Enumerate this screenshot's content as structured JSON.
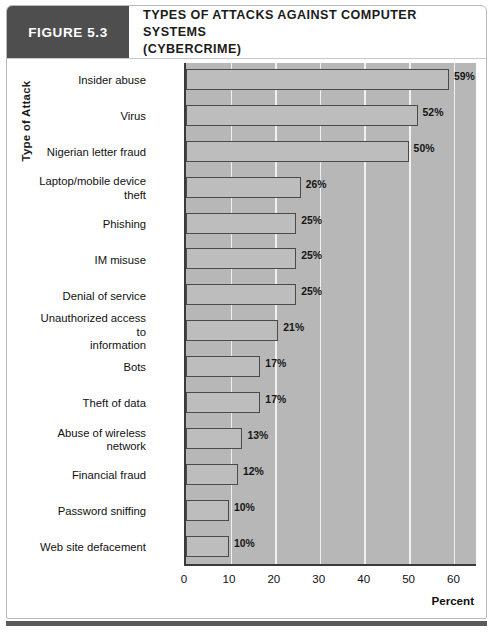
{
  "figure": {
    "badge_label": "FIGURE 5.3",
    "title_line1": "TYPES OF ATTACKS AGAINST COMPUTER SYSTEMS",
    "title_line2": "(CYBERCRIME)"
  },
  "colors": {
    "badge_bg": "#4e4e4e",
    "plot_bg": "#b7b7b7",
    "bar_fill": "#bdbdbd",
    "bar_border": "#4a4a4a",
    "gridline": "#f0f0f0",
    "axis": "#3a3a3a",
    "bottom_rule": "#5a5a5a"
  },
  "chart_data": {
    "type": "bar",
    "orientation": "horizontal",
    "title": "TYPES OF ATTACKS AGAINST COMPUTER SYSTEMS (CYBERCRIME)",
    "xlabel": "Percent",
    "ylabel": "Type of Attack",
    "xlim": [
      0,
      65
    ],
    "xticks": [
      0,
      10,
      20,
      30,
      40,
      50,
      60
    ],
    "xtick_labels": [
      "0",
      "10",
      "20",
      "30",
      "40",
      "50",
      "60"
    ],
    "grid": "vertical",
    "legend": "none",
    "categories": [
      "Insider abuse",
      "Virus",
      "Nigerian letter fraud",
      "Laptop/mobile device theft",
      "Phishing",
      "IM misuse",
      "Denial of service",
      "Unauthorized access to information",
      "Bots",
      "Theft of data",
      "Abuse of wireless network",
      "Financial fraud",
      "Password sniffing",
      "Web site defacement"
    ],
    "values": [
      59,
      52,
      50,
      26,
      25,
      25,
      25,
      21,
      17,
      17,
      13,
      12,
      10,
      10
    ],
    "data_labels": [
      "59%",
      "52%",
      "50%",
      "26%",
      "25%",
      "25%",
      "25%",
      "21%",
      "17%",
      "17%",
      "13%",
      "12%",
      "10%",
      "10%"
    ]
  },
  "category_label_lines": [
    [
      "Insider abuse"
    ],
    [
      "Virus"
    ],
    [
      "Nigerian letter fraud"
    ],
    [
      "Laptop/mobile device",
      "theft"
    ],
    [
      "Phishing"
    ],
    [
      "IM misuse"
    ],
    [
      "Denial of service"
    ],
    [
      "Unauthorized access to",
      "information"
    ],
    [
      "Bots"
    ],
    [
      "Theft of data"
    ],
    [
      "Abuse of wireless",
      "network"
    ],
    [
      "Financial fraud"
    ],
    [
      "Password sniffing"
    ],
    [
      "Web site defacement"
    ]
  ]
}
